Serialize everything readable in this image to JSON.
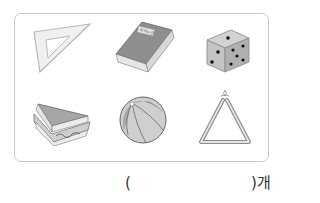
{
  "question": {
    "items": [
      {
        "name": "triangle-ruler",
        "shape": "triangle"
      },
      {
        "name": "dictionary-book",
        "shape": "cuboid",
        "title": "국어사전"
      },
      {
        "name": "dice",
        "shape": "cube"
      },
      {
        "name": "sandwich",
        "shape": "triangular-prism"
      },
      {
        "name": "beach-ball",
        "shape": "sphere"
      },
      {
        "name": "triangle-instrument",
        "shape": "triangle"
      }
    ],
    "answer": {
      "open_paren": "(",
      "value": "",
      "close_paren_unit": ")개"
    }
  },
  "colors": {
    "frame_border": "#c8c8c8",
    "object_fill": "#9a9a9a",
    "light_fill": "#dcdcdc"
  }
}
